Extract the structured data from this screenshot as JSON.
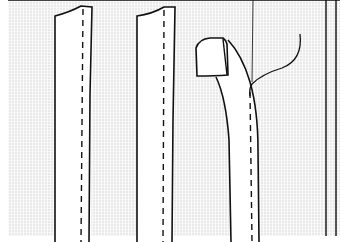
{
  "figure": {
    "background_color": "#e9e9e9",
    "line_color": "#111111",
    "strip_fill": "#ffffff",
    "strips": [
      {
        "id": "strip-1",
        "left_x": 55,
        "right_x": 92,
        "stitch_x": 82,
        "top_left_y": 15,
        "top_right_y": 7
      },
      {
        "id": "strip-2",
        "left_x": 137,
        "right_x": 175,
        "stitch_x": 163,
        "top_left_y": 15,
        "top_right_y": 7
      },
      {
        "id": "strip-3",
        "left_x": 230,
        "right_x": 258,
        "stitch_x": 252,
        "folded_tab": true
      }
    ],
    "labels": []
  }
}
